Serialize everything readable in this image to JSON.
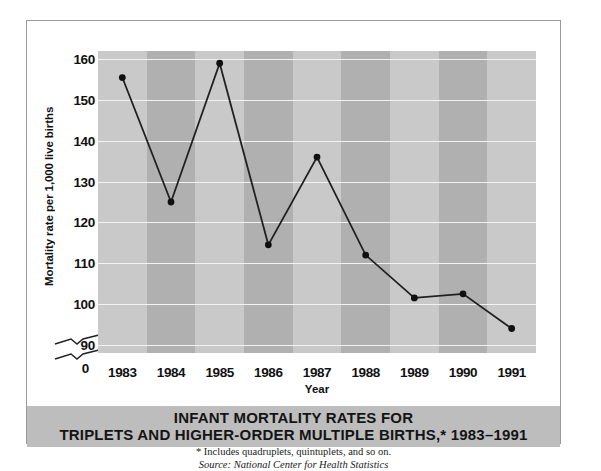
{
  "chart_data": {
    "type": "line",
    "title": "INFANT MORTALITY RATES FOR TRIPLETS AND HIGHER-ORDER MULTIPLE BIRTHS,* 1983–1991",
    "title_lines": [
      "INFANT MORTALITY RATES FOR",
      "TRIPLETS AND HIGHER-ORDER MULTIPLE BIRTHS,* 1983–1991"
    ],
    "xlabel": "Year",
    "ylabel": "Mortality rate per 1,000 live births",
    "categories": [
      "1983",
      "1984",
      "1985",
      "1986",
      "1987",
      "1988",
      "1989",
      "1990",
      "1991"
    ],
    "values": [
      155.5,
      125.0,
      159.0,
      114.5,
      136.0,
      112.0,
      101.5,
      102.5,
      94.0
    ],
    "yticks": [
      "160",
      "150",
      "140",
      "130",
      "120",
      "110",
      "100",
      "90"
    ],
    "ytick_values": [
      160,
      150,
      140,
      130,
      120,
      110,
      100,
      90
    ],
    "zero_tick": "0",
    "ylim": [
      88,
      162
    ],
    "axis_break": true,
    "grid": true,
    "legend": "none",
    "marker": "filled-circle",
    "line_color": "#202020",
    "marker_color": "#101010",
    "gridline_color": "#f2f2f2",
    "band_light_color": "#c9c9c9",
    "band_dark_color": "#b0b0b0",
    "title_band_color": "#bdbdbd",
    "footnote": "* Includes quadruplets, quintuplets, and so on.",
    "source": "Source: National Center for Health Statistics"
  }
}
